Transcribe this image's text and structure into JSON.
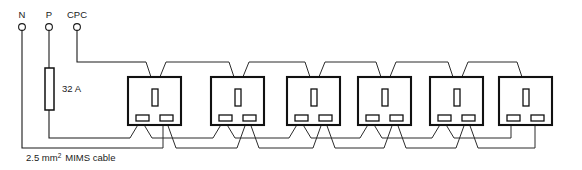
{
  "diagram": {
    "supply_terminals": [
      {
        "id": "neutral",
        "label": "N",
        "x": 22
      },
      {
        "id": "phase",
        "label": "P",
        "x": 49
      },
      {
        "id": "cpc",
        "label": "CPC",
        "x": 77
      }
    ],
    "fuse": {
      "rating_label": "32 A",
      "x": 45,
      "y": 68,
      "width": 9,
      "height": 42
    },
    "cable_note": {
      "value": "2.5 mm",
      "superscript": "2",
      "suffix": "MIMS cable",
      "x": 26,
      "y": 161
    },
    "sockets": [
      {
        "id": "socket-1",
        "x": 128,
        "y": 77
      },
      {
        "id": "socket-2",
        "x": 211,
        "y": 77
      },
      {
        "id": "socket-3",
        "x": 287,
        "y": 77
      },
      {
        "id": "socket-4",
        "x": 358,
        "y": 77
      },
      {
        "id": "socket-5",
        "x": 430,
        "y": 77
      },
      {
        "id": "socket-6",
        "x": 499,
        "y": 77
      }
    ],
    "socket_geometry": {
      "width": 53,
      "height": 48,
      "earth_slot": {
        "dx": 24,
        "dy": 12,
        "w": 6,
        "h": 17
      },
      "live_slot": {
        "dx": 8,
        "dy": 38,
        "w": 13,
        "h": 6
      },
      "neutral_slot": {
        "dx": 32,
        "dy": 38,
        "w": 13,
        "h": 6
      }
    },
    "bus_lines": {
      "cpc_y": 62,
      "phase_y": 138,
      "neutral_y": 148
    },
    "colors": {
      "stroke": "#111111",
      "background": "#ffffff"
    }
  }
}
